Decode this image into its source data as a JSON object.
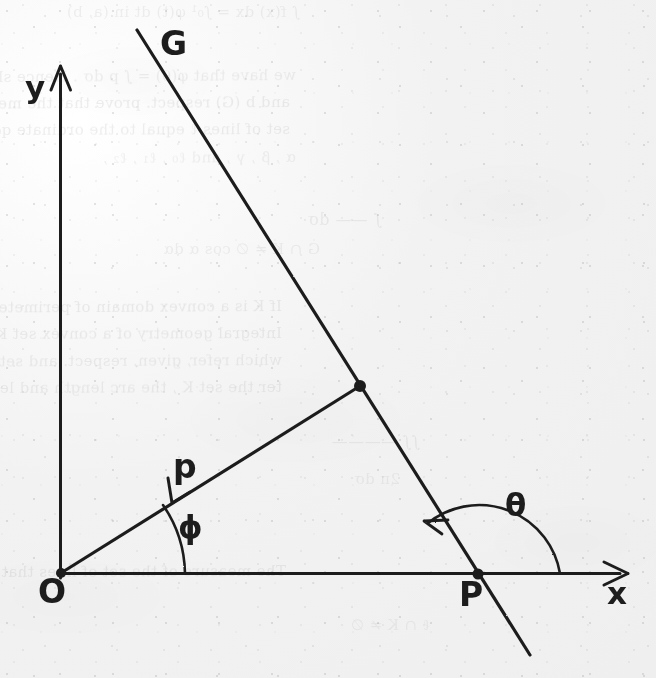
{
  "document": {
    "kind": "scanned-textbook-page",
    "paper_color": "#f4f4f4",
    "ink_color": "#1d1d1d"
  },
  "figure": {
    "caption": "",
    "axes": {
      "y_label": "y",
      "x_label": "x"
    },
    "points": [
      {
        "id": "origin",
        "label": "O",
        "x": 61,
        "y": 573
      },
      {
        "id": "foot",
        "label": "",
        "x": 360,
        "y": 386
      },
      {
        "id": "x-intercept",
        "label": "P",
        "x": 478,
        "y": 574
      }
    ],
    "lines": [
      {
        "id": "line-G",
        "label": "G",
        "from_x": 137,
        "from_y": 30,
        "to_x": 530,
        "to_y": 655
      },
      {
        "id": "segment-p",
        "label": "p",
        "from_x": 61,
        "from_y": 573,
        "to_x": 360,
        "to_y": 386
      }
    ],
    "angles": [
      {
        "id": "angle-phi",
        "label": "ϕ",
        "vertex": "O",
        "from": "x-axis",
        "to": "p"
      },
      {
        "id": "angle-theta",
        "label": "θ",
        "vertex": "P",
        "from": "x-axis",
        "to": "line-G"
      }
    ]
  },
  "background_text": {
    "note": "faint mirrored show-through from the reverse side of the sheet",
    "lines": [
      {
        "text": "∫ f(x) dx  =  ∫₀¹ φ(t) dt   in  (a, b)",
        "x": 300,
        "y": 3,
        "size": 15,
        "opacity": 0.075,
        "rotate": 0
      },
      {
        "text": "we have that  φ(θ) = ∫ p dσ .   Hence  show that",
        "x": 296,
        "y": 66,
        "size": 15,
        "opacity": 0.085,
        "rotate": 0.4
      },
      {
        "text": "and  b (G)  respect.  prove  that  the  measure  of  the",
        "x": 290,
        "y": 93,
        "size": 15,
        "opacity": 0.095,
        "rotate": 0.3
      },
      {
        "text": "set  of  lines  ℓ  equal  to  the  ordinate  q₀  of  set  of",
        "x": 290,
        "y": 120,
        "size": 15,
        "opacity": 0.09,
        "rotate": 0.2
      },
      {
        "text": "α , β , γ ,  and  ℓ₀ ,  ℓ₁ ,  ℓ₂ ,",
        "x": 296,
        "y": 148,
        "size": 15,
        "opacity": 0.075,
        "rotate": 0.3
      },
      {
        "text": "∫   —— dσ",
        "x": 382,
        "y": 210,
        "size": 16,
        "opacity": 0.08,
        "rotate": 0
      },
      {
        "text": "G ∩ K ≠ ∅            cos α dα",
        "x": 320,
        "y": 240,
        "size": 15,
        "opacity": 0.075,
        "rotate": 0
      },
      {
        "text": "If  K  is  a  convex  domain  of  perimeter  L  ,  it  holds",
        "x": 282,
        "y": 297,
        "size": 15,
        "opacity": 0.095,
        "rotate": 0.3
      },
      {
        "text": "Integral  geometry  of  a  convex  set  K  .  The  measure  of  the",
        "x": 282,
        "y": 324,
        "size": 15,
        "opacity": 0.09,
        "rotate": 0.2
      },
      {
        "text": "which  refer,  given,  respect.  and  set  K  .  Then  the",
        "x": 282,
        "y": 351,
        "size": 15,
        "opacity": 0.085,
        "rotate": 0.3
      },
      {
        "text": "ter  the  set  K  ,  the  arc  length  and  length  L  .  The  set",
        "x": 282,
        "y": 378,
        "size": 15,
        "opacity": 0.085,
        "rotate": 0.2
      },
      {
        "text": "∫∫  ———— ",
        "x": 420,
        "y": 432,
        "size": 16,
        "opacity": 0.075,
        "rotate": 0
      },
      {
        "text": "2π                dσ",
        "x": 400,
        "y": 470,
        "size": 15,
        "opacity": 0.07,
        "rotate": 0
      },
      {
        "text": "The  measure  of  the  set  of  lines  that  determine  K  .  ",
        "x": 286,
        "y": 562,
        "size": 15,
        "opacity": 0.09,
        "rotate": 0.2
      },
      {
        "text": "ℓ  ∩  K   ≠   ∅",
        "x": 430,
        "y": 616,
        "size": 15,
        "opacity": 0.065,
        "rotate": 0
      }
    ]
  }
}
